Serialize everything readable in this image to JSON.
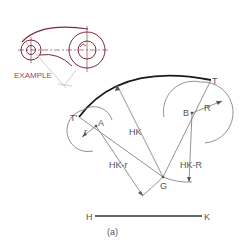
{
  "figure": {
    "caption": "(a)",
    "colors": {
      "main_line": "#1a1a1a",
      "construction_line": "#777777",
      "example_line": "#7a2a3a",
      "example_text": "#9a4a5a",
      "label_text": "#555555"
    }
  },
  "example_inset": {
    "label": "EXAMPLE"
  },
  "labels": {
    "T_prime": "T'",
    "T": "T",
    "A": "A",
    "B": "B",
    "G": "G",
    "r": "r",
    "R": "R",
    "HK": "HK",
    "HK_minus_r": "HK-r",
    "HK_minus_R": "HK-R",
    "H": "H",
    "K": "K"
  }
}
